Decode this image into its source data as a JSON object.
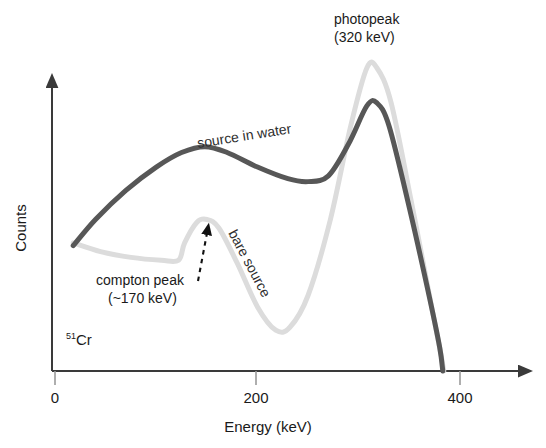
{
  "chart_data": {
    "type": "line",
    "title": "",
    "xlabel": "Energy (keV)",
    "ylabel": "Counts",
    "xlim": [
      0,
      450
    ],
    "ylim": [
      0,
      100
    ],
    "xticks": [
      0,
      200,
      400
    ],
    "xtick_labels": [
      "0",
      "200",
      "400"
    ],
    "yticks": [],
    "grid": false,
    "legend_position": "inline-curve-labels",
    "series": [
      {
        "name": "source in water",
        "color": "#575757",
        "points": [
          {
            "x": 18,
            "y": 43
          },
          {
            "x": 40,
            "y": 52
          },
          {
            "x": 70,
            "y": 62
          },
          {
            "x": 100,
            "y": 70
          },
          {
            "x": 125,
            "y": 75
          },
          {
            "x": 148,
            "y": 77
          },
          {
            "x": 170,
            "y": 75
          },
          {
            "x": 200,
            "y": 70
          },
          {
            "x": 230,
            "y": 66
          },
          {
            "x": 250,
            "y": 65
          },
          {
            "x": 270,
            "y": 67
          },
          {
            "x": 290,
            "y": 78
          },
          {
            "x": 308,
            "y": 91
          },
          {
            "x": 318,
            "y": 92
          },
          {
            "x": 330,
            "y": 84
          },
          {
            "x": 350,
            "y": 56
          },
          {
            "x": 370,
            "y": 25
          },
          {
            "x": 380,
            "y": 8
          },
          {
            "x": 383,
            "y": 0
          }
        ]
      },
      {
        "name": "bare source",
        "color": "#dcdcdc",
        "points": [
          {
            "x": 18,
            "y": 44
          },
          {
            "x": 45,
            "y": 41
          },
          {
            "x": 75,
            "y": 39
          },
          {
            "x": 105,
            "y": 38
          },
          {
            "x": 122,
            "y": 38
          },
          {
            "x": 128,
            "y": 44
          },
          {
            "x": 140,
            "y": 51
          },
          {
            "x": 150,
            "y": 52
          },
          {
            "x": 162,
            "y": 49
          },
          {
            "x": 180,
            "y": 37
          },
          {
            "x": 200,
            "y": 22
          },
          {
            "x": 218,
            "y": 14
          },
          {
            "x": 232,
            "y": 15
          },
          {
            "x": 250,
            "y": 26
          },
          {
            "x": 272,
            "y": 52
          },
          {
            "x": 292,
            "y": 84
          },
          {
            "x": 308,
            "y": 104
          },
          {
            "x": 318,
            "y": 104
          },
          {
            "x": 332,
            "y": 92
          },
          {
            "x": 352,
            "y": 58
          },
          {
            "x": 372,
            "y": 22
          },
          {
            "x": 381,
            "y": 6
          },
          {
            "x": 384,
            "y": 0
          }
        ]
      }
    ],
    "annotations": [
      {
        "name": "photopeak",
        "lines": [
          "photopeak",
          "(320 keV)"
        ],
        "x_px": 334,
        "y_px": 24
      },
      {
        "name": "compton-peak",
        "lines": [
          "compton peak",
          "(~170 keV)"
        ],
        "x_px": 96,
        "y_px": 285
      },
      {
        "name": "isotope",
        "superscript": "51",
        "text": "Cr",
        "x_px": 66,
        "y_px": 345
      }
    ],
    "curve_labels": [
      {
        "name": "source in water",
        "x_px": 198,
        "y_px": 148,
        "rotation": -9
      },
      {
        "name": "bare source",
        "x_px": 228,
        "y_px": 233,
        "rotation": 62
      }
    ],
    "pointer": {
      "name": "compton-peak-arrow",
      "style": "dashed-arrow",
      "from": {
        "x_px": 198,
        "y_px": 281
      },
      "to": {
        "x_px": 207,
        "y_px": 231
      }
    }
  },
  "axes": {
    "x_axis_label": "Energy (keV)",
    "y_axis_label": "Counts",
    "x_tick_0": "0",
    "x_tick_200": "200",
    "x_tick_400": "400"
  },
  "colors": {
    "axis": "#3a3a3a",
    "dark_curve": "#575757",
    "light_curve": "#dcdcdc",
    "text": "#1a1a1a",
    "background": "#ffffff"
  }
}
